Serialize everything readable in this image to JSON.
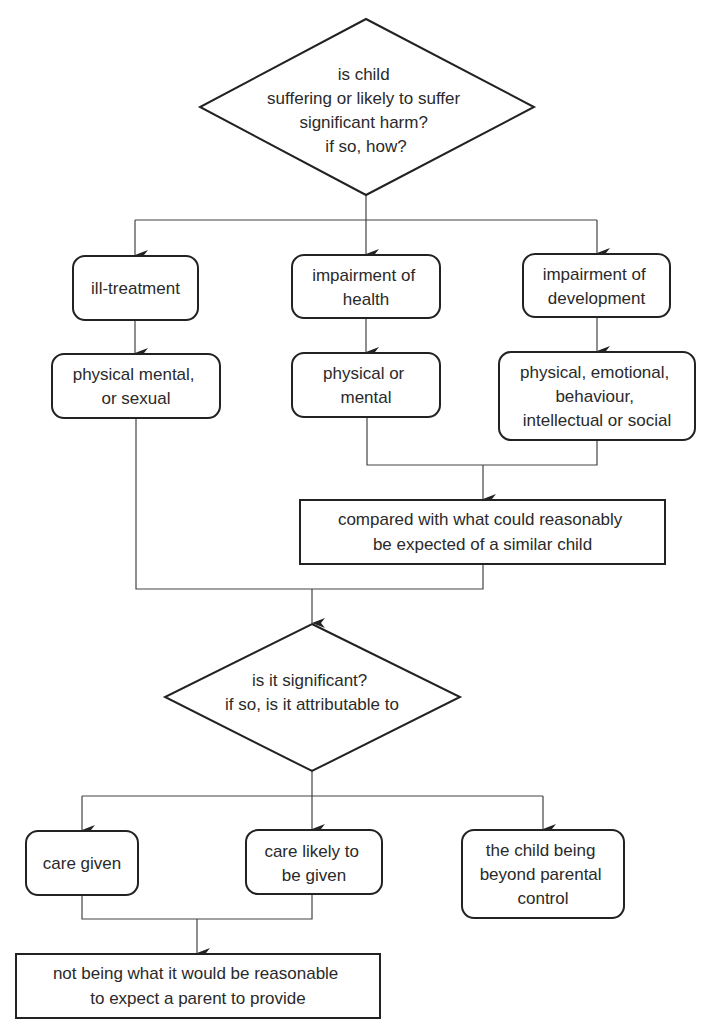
{
  "diagram": {
    "type": "flowchart",
    "nodes": {
      "q1": {
        "shape": "diamond",
        "lines": [
          "is child",
          "suffering or likely to suffer",
          "significant harm?",
          "if so, how?"
        ]
      },
      "ill_treatment": {
        "shape": "rounded-rect",
        "lines": [
          "ill-treatment"
        ]
      },
      "impairment_health": {
        "shape": "rounded-rect",
        "lines": [
          "impairment of",
          "health"
        ]
      },
      "impairment_development": {
        "shape": "rounded-rect",
        "lines": [
          "impairment of",
          "development"
        ]
      },
      "ill_treatment_types": {
        "shape": "rounded-rect",
        "lines": [
          "physical mental,",
          "or sexual"
        ]
      },
      "health_types": {
        "shape": "rounded-rect",
        "lines": [
          "physical or",
          "mental"
        ]
      },
      "development_types": {
        "shape": "rounded-rect",
        "lines": [
          "physical, emotional,",
          "behaviour,",
          "intellectual or social"
        ]
      },
      "compared": {
        "shape": "rect",
        "lines": [
          "compared with what could reasonably",
          "be expected of a similar child"
        ]
      },
      "q2": {
        "shape": "diamond",
        "lines": [
          "is it significant?",
          "if so, is it attributable to"
        ]
      },
      "care_given": {
        "shape": "rounded-rect",
        "lines": [
          "care given"
        ]
      },
      "care_likely": {
        "shape": "rounded-rect",
        "lines": [
          "care likely to",
          "be given"
        ]
      },
      "beyond_control": {
        "shape": "rounded-rect",
        "lines": [
          "the child being",
          "beyond parental",
          "control"
        ]
      },
      "not_reasonable": {
        "shape": "rect",
        "lines": [
          "not being what it would be reasonable",
          "to expect a parent to provide"
        ]
      }
    },
    "edges": [
      [
        "q1",
        "ill_treatment"
      ],
      [
        "q1",
        "impairment_health"
      ],
      [
        "q1",
        "impairment_development"
      ],
      [
        "ill_treatment",
        "ill_treatment_types"
      ],
      [
        "impairment_health",
        "health_types"
      ],
      [
        "impairment_development",
        "development_types"
      ],
      [
        "health_types",
        "compared"
      ],
      [
        "development_types",
        "compared"
      ],
      [
        "ill_treatment_types",
        "q2"
      ],
      [
        "compared",
        "q2"
      ],
      [
        "q2",
        "care_given"
      ],
      [
        "q2",
        "care_likely"
      ],
      [
        "q2",
        "beyond_control"
      ],
      [
        "care_given",
        "not_reasonable"
      ],
      [
        "care_likely",
        "not_reasonable"
      ]
    ]
  }
}
